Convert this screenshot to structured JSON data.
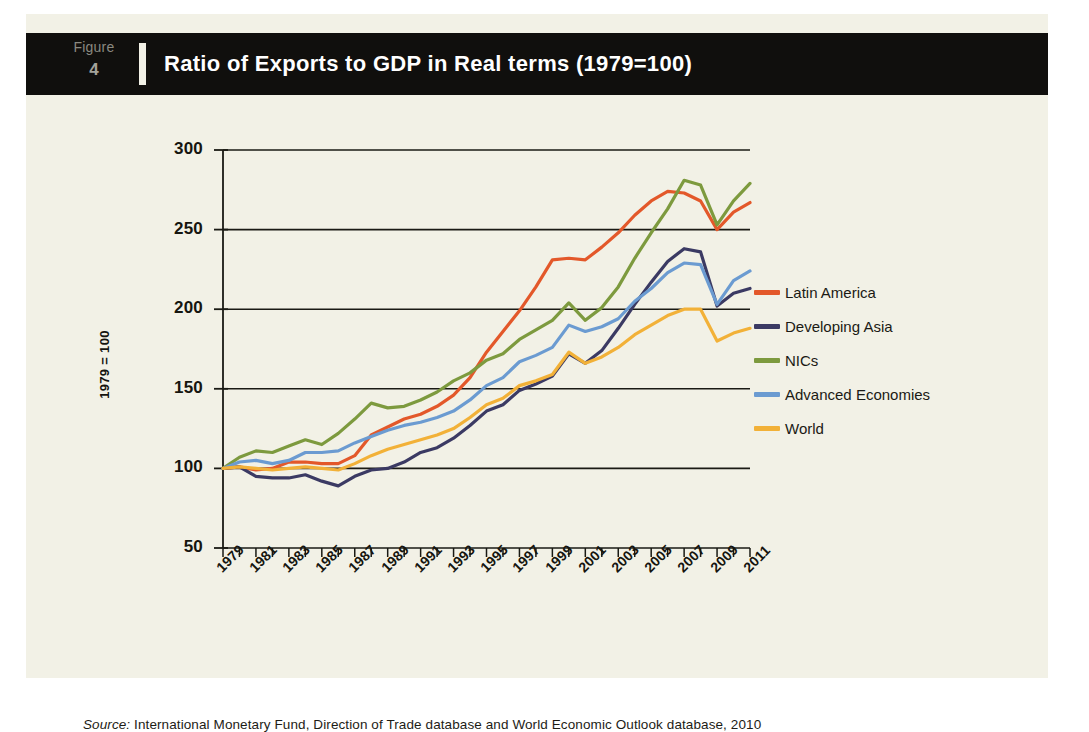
{
  "figure": {
    "label_word": "Figure",
    "number": "4",
    "title": "Ratio of Exports to GDP in Real terms (1979=100)"
  },
  "source": {
    "prefix": "Source:",
    "text": " International Monetary Fund, Direction of Trade database and World Economic Outlook database, 2010"
  },
  "colors": {
    "background_paper": "#f2f1e6",
    "header_band": "#100f0d",
    "axis": "#1a1a14",
    "latin_america": "#e3582a",
    "developing_asia": "#3b3a63",
    "nics": "#7d9a3e",
    "advanced_economies": "#6b9bd1",
    "world": "#f2b138"
  },
  "chart_data": {
    "type": "line",
    "title": "Ratio of Exports to GDP in Real terms (1979=100)",
    "xlabel": "",
    "ylabel": "1979 = 100",
    "ylim": [
      50,
      300
    ],
    "yticks": [
      50,
      100,
      150,
      200,
      250,
      300
    ],
    "grid": "horizontal",
    "legend_position": "right",
    "xlim": [
      1979,
      2011
    ],
    "xticks": [
      1979,
      1981,
      1983,
      1985,
      1987,
      1989,
      1991,
      1993,
      1995,
      1997,
      1999,
      2001,
      2003,
      2005,
      2007,
      2009,
      2011
    ],
    "x": [
      1979,
      1980,
      1981,
      1982,
      1983,
      1984,
      1985,
      1986,
      1987,
      1988,
      1989,
      1990,
      1991,
      1992,
      1993,
      1994,
      1995,
      1996,
      1997,
      1998,
      1999,
      2000,
      2001,
      2002,
      2003,
      2004,
      2005,
      2006,
      2007,
      2008,
      2009,
      2010,
      2011
    ],
    "series": [
      {
        "name": "Latin America",
        "color": "#e3582a",
        "values": [
          100,
          101,
          99,
          100,
          104,
          104,
          103,
          103,
          108,
          121,
          126,
          131,
          134,
          139,
          146,
          157,
          173,
          186,
          199,
          214,
          231,
          232,
          231,
          239,
          248,
          259,
          268,
          274,
          273,
          268,
          250,
          261,
          267
        ]
      },
      {
        "name": "Developing Asia",
        "color": "#3b3a63",
        "values": [
          100,
          101,
          95,
          94,
          94,
          96,
          92,
          89,
          95,
          99,
          100,
          104,
          110,
          113,
          119,
          127,
          136,
          140,
          149,
          153,
          158,
          172,
          166,
          174,
          188,
          203,
          217,
          230,
          238,
          236,
          202,
          210,
          213
        ]
      },
      {
        "name": "NICs",
        "color": "#7d9a3e",
        "values": [
          100,
          107,
          111,
          110,
          114,
          118,
          115,
          122,
          131,
          141,
          138,
          139,
          143,
          148,
          155,
          160,
          168,
          172,
          181,
          187,
          193,
          204,
          193,
          201,
          214,
          232,
          248,
          263,
          281,
          278,
          253,
          268,
          279
        ]
      },
      {
        "name": "Advanced Economies",
        "color": "#6b9bd1",
        "values": [
          100,
          104,
          105,
          103,
          105,
          110,
          110,
          111,
          116,
          120,
          124,
          127,
          129,
          132,
          136,
          143,
          152,
          157,
          167,
          171,
          176,
          190,
          186,
          189,
          194,
          205,
          213,
          223,
          229,
          228,
          203,
          218,
          224
        ]
      },
      {
        "name": "World",
        "color": "#f2b138",
        "values": [
          100,
          101,
          100,
          99,
          100,
          101,
          100,
          99,
          103,
          108,
          112,
          115,
          118,
          121,
          125,
          132,
          140,
          144,
          152,
          155,
          159,
          173,
          166,
          170,
          176,
          184,
          190,
          196,
          200,
          200,
          180,
          185,
          188
        ]
      }
    ]
  },
  "legend": {
    "items": [
      {
        "label": "Latin America",
        "color": "#e3582a"
      },
      {
        "label": "Developing Asia",
        "color": "#3b3a63"
      },
      {
        "label": "NICs",
        "color": "#7d9a3e"
      },
      {
        "label": "Advanced Economies",
        "color": "#6b9bd1"
      },
      {
        "label": "World",
        "color": "#f2b138"
      }
    ]
  }
}
